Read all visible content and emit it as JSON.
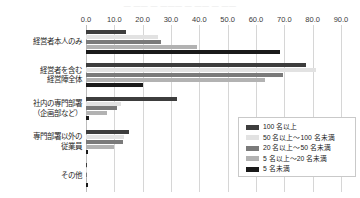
{
  "top_ghost_text": "— —— — ——— — —— — ——",
  "chart_data": {
    "type": "bar",
    "orientation": "horizontal",
    "title": "",
    "subtitle": "",
    "xlabel": "",
    "ylabel": "",
    "xlim": [
      0.0,
      90.0
    ],
    "xticks": [
      "0.0",
      "10.0",
      "20.0",
      "30.0",
      "40.0",
      "50.0",
      "60.0",
      "70.0",
      "80.0",
      "90.0"
    ],
    "xtick_values": [
      0,
      10,
      20,
      30,
      40,
      50,
      60,
      70,
      80,
      90
    ],
    "grid": true,
    "grid_axis": "x",
    "legend_position": "bottom-right",
    "categories": [
      "経営者本人のみ",
      "経営者を含む\n経営陣全体",
      "社内の専門部署\n（企画部など）",
      "専門部署以外の\n従業員",
      "その他"
    ],
    "series": [
      {
        "name": "100 名以上",
        "color": "#3d3d3d",
        "values": [
          14.0,
          77.5,
          32.0,
          15.0,
          0.4
        ]
      },
      {
        "name": "50 名以上～100 名未満",
        "color": "#e2e2e2",
        "values": [
          25.5,
          81.0,
          12.5,
          13.5,
          0.3
        ]
      },
      {
        "name": "20 名以上～50 名未満",
        "color": "#7a7a7a",
        "values": [
          26.5,
          69.5,
          11.0,
          13.0,
          0.3
        ]
      },
      {
        "name": "5 名以上～20 名未満",
        "color": "#b2b2b2",
        "values": [
          39.0,
          63.0,
          7.5,
          10.0,
          0.5
        ]
      },
      {
        "name": "5 名未満",
        "color": "#1a1a1a",
        "values": [
          68.5,
          20.0,
          1.0,
          0.7,
          0.6
        ]
      }
    ]
  },
  "legend": {
    "items": [
      {
        "label": "100 名以上",
        "color": "#3d3d3d"
      },
      {
        "label": "50 名以上～100 名未満",
        "color": "#e2e2e2"
      },
      {
        "label": "20 名以上～50 名未満",
        "color": "#7a7a7a"
      },
      {
        "label": "5 名以上～20 名未満",
        "color": "#b2b2b2"
      },
      {
        "label": "5 名未満",
        "color": "#1a1a1a"
      }
    ]
  }
}
